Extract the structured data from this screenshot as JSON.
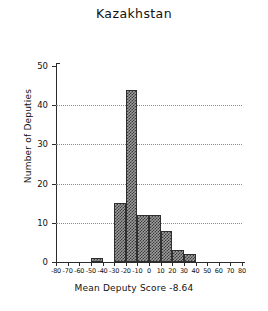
{
  "chart_data": {
    "type": "bar",
    "title": "Kazakhstan",
    "xlabel": "Mean Deputy Score  -8.64",
    "ylabel": "Number of Deputies",
    "mean_deputy_score": -8.64,
    "bin_width": 10,
    "xlim": [
      -80,
      80
    ],
    "ylim": [
      0,
      50
    ],
    "grid": "horizontal-dotted",
    "legend": "none",
    "xticks": [
      -80,
      -70,
      -60,
      -50,
      -40,
      -30,
      -20,
      -10,
      0,
      10,
      20,
      30,
      40,
      50,
      60,
      70,
      80
    ],
    "xtick_labels": [
      "-80",
      "-70",
      "-60",
      "-50",
      "-40",
      "-30",
      "-20",
      "-10",
      "0",
      "10",
      "20",
      "30",
      "40",
      "50",
      "60",
      "70",
      "80"
    ],
    "yticks": [
      0,
      10,
      20,
      30,
      40,
      50
    ],
    "ytick_labels": [
      "0",
      "10",
      "20",
      "30",
      "40",
      "50"
    ],
    "bins": [
      {
        "left": -50,
        "right": -40,
        "value": 1
      },
      {
        "left": -30,
        "right": -20,
        "value": 15
      },
      {
        "left": -20,
        "right": -10,
        "value": 44
      },
      {
        "left": -10,
        "right": 0,
        "value": 12
      },
      {
        "left": 0,
        "right": 10,
        "value": 12
      },
      {
        "left": 10,
        "right": 20,
        "value": 8
      },
      {
        "left": 20,
        "right": 30,
        "value": 3
      },
      {
        "left": 30,
        "right": 40,
        "value": 2
      }
    ],
    "categories": [
      "-50",
      "-30",
      "-20",
      "-10",
      "0",
      "10",
      "20",
      "30"
    ],
    "values": [
      1,
      15,
      44,
      12,
      12,
      8,
      3,
      2
    ]
  },
  "style": {
    "bar_fill": "#9d9d9d",
    "bar_edge": "#2f2f2f",
    "axis_color": "#2b2b2b",
    "grid_color": "#8a8a8a",
    "background": "#ffffff"
  }
}
